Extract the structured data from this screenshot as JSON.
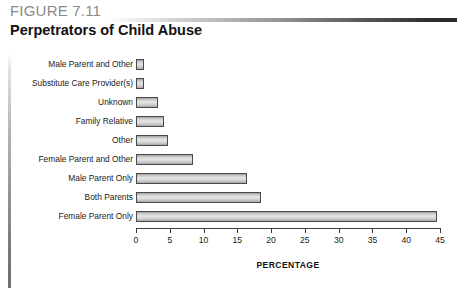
{
  "header": {
    "figure_number": "FIGURE 7.11",
    "title": "Perpetrators of Child Abuse"
  },
  "chart_data": {
    "type": "bar",
    "orientation": "horizontal",
    "title": "Perpetrators of Child Abuse",
    "xlabel": "PERCENTAGE",
    "ylabel": "",
    "xlim": [
      0,
      45
    ],
    "xticks": [
      0,
      5,
      10,
      15,
      20,
      25,
      30,
      35,
      40,
      45
    ],
    "xtick_labels": [
      "0",
      "5",
      "10",
      "15",
      "20",
      "25",
      "30",
      "35",
      "40",
      "45"
    ],
    "grid": false,
    "legend": false,
    "categories": [
      "Male Parent and Other",
      "Substitute Care Provider(s)",
      "Unknown",
      "Family Relative",
      "Other",
      "Female Parent and Other",
      "Male Parent Only",
      "Both Parents",
      "Female Parent Only"
    ],
    "values": [
      1.2,
      1.2,
      3.3,
      4.2,
      4.7,
      8.5,
      16.5,
      18.5,
      44.5
    ],
    "bars": [
      {
        "label": "Male Parent and Other",
        "value": 1.2
      },
      {
        "label": "Substitute Care Provider(s)",
        "value": 1.2
      },
      {
        "label": "Unknown",
        "value": 3.3
      },
      {
        "label": "Family Relative",
        "value": 4.2
      },
      {
        "label": "Other",
        "value": 4.7
      },
      {
        "label": "Female Parent and Other",
        "value": 8.5
      },
      {
        "label": "Male Parent Only",
        "value": 16.5
      },
      {
        "label": "Both Parents",
        "value": 18.5
      },
      {
        "label": "Female Parent Only",
        "value": 44.5
      }
    ],
    "colors": {
      "bar_border": "#4a4a4a",
      "bar_fill_light": "#e6e6e6",
      "bar_fill_dark": "#9e9e9e",
      "axis": "#3d3d3d",
      "text": "#1a1a1a",
      "figure_number": "#8a8a8a"
    }
  }
}
